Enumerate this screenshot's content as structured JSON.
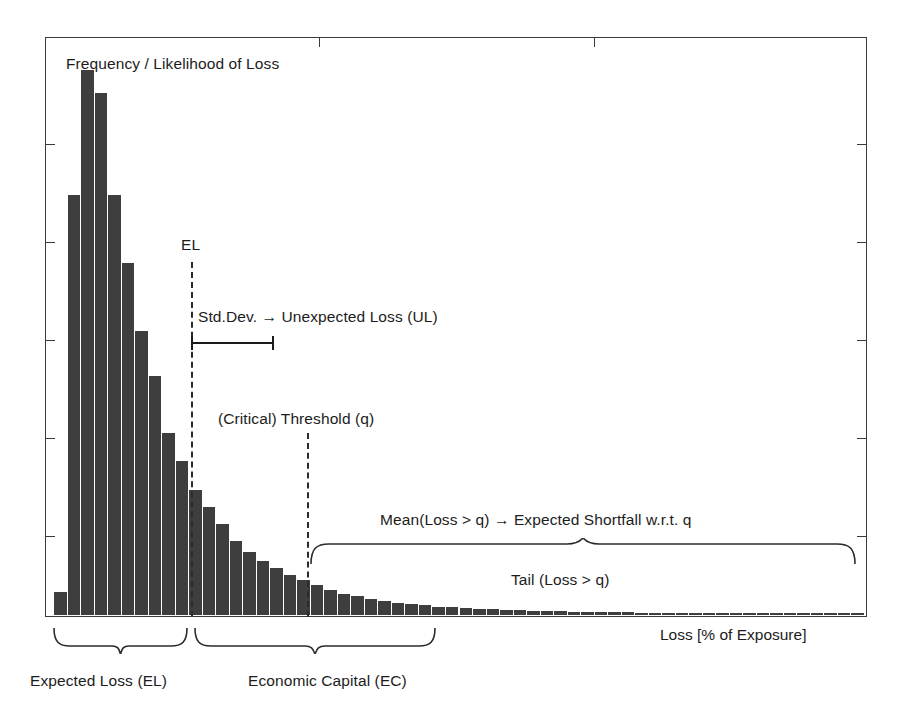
{
  "figure": {
    "title_inside": "Frequency / Likelihood of Loss",
    "xlabel": "Loss [% of Exposure]"
  },
  "annotations": {
    "el_label": "EL",
    "std_dev_label": "Std.Dev. → Unexpected Loss (UL)",
    "threshold_label": "(Critical) Threshold (q)",
    "expected_shortfall_label": "Mean(Loss > q) → Expected Shortfall w.r.t. q",
    "tail_label": "Tail (Loss > q)",
    "expected_loss_brace_label": "Expected Loss (EL)",
    "economic_capital_brace_label": "Economic Capital (EC)"
  },
  "colors": {
    "bar_fill": "#3e3e3e",
    "frame": "#3a3a3a",
    "text": "#1c1c1c",
    "background": "#ffffff"
  },
  "chart_data": {
    "type": "bar",
    "title": "Frequency / Likelihood of Loss",
    "xlabel": "Loss [% of Exposure]",
    "ylabel": "Frequency / Likelihood of Loss",
    "grid": false,
    "legend": null,
    "axis_ticks": {
      "y_tick_count": 5,
      "y_tick_labels": [],
      "x_tick_count": 2,
      "x_tick_labels": []
    },
    "categories": [
      "b1",
      "b2",
      "b3",
      "b4",
      "b5",
      "b6",
      "b7",
      "b8",
      "b9",
      "b10",
      "b11",
      "b12",
      "b13",
      "b14",
      "b15",
      "b16",
      "b17",
      "b18",
      "b19",
      "b20",
      "b21",
      "b22",
      "b23",
      "b24",
      "b25",
      "b26",
      "b27",
      "b28",
      "b29",
      "b30",
      "b31",
      "b32",
      "b33",
      "b34",
      "b35",
      "b36",
      "b37",
      "b38",
      "b39",
      "b40",
      "b41",
      "b42",
      "b43",
      "b44",
      "b45",
      "b46",
      "b47",
      "b48",
      "b49",
      "b50",
      "b51",
      "b52",
      "b53",
      "b54",
      "b55",
      "b56",
      "b57",
      "b58",
      "b59",
      "b60"
    ],
    "values": [
      4,
      74,
      96,
      92,
      74,
      62,
      50,
      42,
      32,
      27,
      22,
      19,
      16,
      13,
      11,
      9.5,
      8.2,
      7.0,
      6.0,
      5.2,
      4.4,
      3.7,
      3.2,
      2.8,
      2.4,
      2.1,
      1.8,
      1.6,
      1.4,
      1.25,
      1.1,
      1.0,
      0.9,
      0.82,
      0.75,
      0.68,
      0.62,
      0.57,
      0.52,
      0.48,
      0.44,
      0.41,
      0.38,
      0.35,
      0.33,
      0.31,
      0.29,
      0.27,
      0.25,
      0.24,
      0.22,
      0.21,
      0.2,
      0.19,
      0.18,
      0.17,
      0.16,
      0.15,
      0.14,
      0.13
    ],
    "ylim": [
      0,
      100
    ],
    "annotations": [
      {
        "name": "el-line",
        "type": "vline",
        "label": "EL",
        "x_index": 10
      },
      {
        "name": "threshold-line",
        "type": "vline",
        "label": "(Critical) Threshold (q)",
        "x_index": 19
      },
      {
        "name": "std-dev-range",
        "type": "errorbar",
        "label": "Std.Dev. → Unexpected Loss (UL)"
      },
      {
        "name": "tail-brace",
        "type": "brace",
        "label": "Tail (Loss > q)"
      },
      {
        "name": "expected-shortfall-brace",
        "type": "brace",
        "label": "Mean(Loss > q) → Expected Shortfall w.r.t. q"
      },
      {
        "name": "expected-loss-brace",
        "type": "brace",
        "label": "Expected Loss (EL)"
      },
      {
        "name": "economic-capital-brace",
        "type": "brace",
        "label": "Economic Capital (EC)"
      }
    ]
  }
}
